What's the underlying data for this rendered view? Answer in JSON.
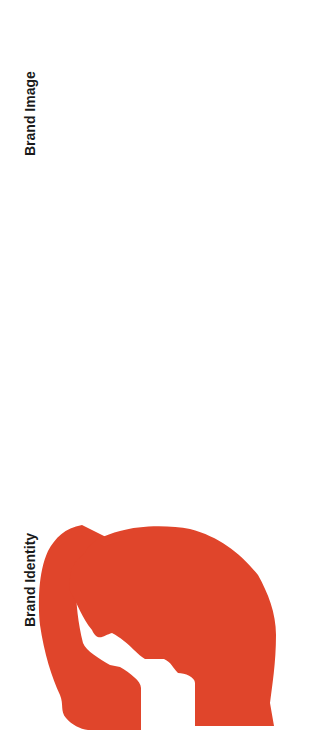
{
  "diagram": {
    "orientation": "rotated-90-ccw",
    "colors": {
      "identity_head": "#e0452b",
      "image_head": "#aaa797",
      "identity_head_text": "#ffffff",
      "image_head_text": "#1a1a1a",
      "box_border": "#3a3a3a",
      "arrow": "#1a1a1a"
    },
    "left_section": {
      "title": "Brand Identity",
      "head_label_line1": "Self-image of",
      "head_label_line2": "internal target groups"
    },
    "right_section": {
      "title": "Brand Image",
      "head_label_line1": "Public-image of",
      "head_label_line2": "external target groups"
    },
    "steps": [
      {
        "label": "Choice of\nsenses",
        "question": "Which senses\nare suited to\nconveying the\nbrand identity?",
        "example": "E.g. sight and\nsmell"
      },
      {
        "label": "Design of the\nstimuli",
        "question": "How should the\nbrand identity be\nconveyed in a\nmulti-sensual\nmanner?",
        "example": "E.g. conveying\nthe brand origin\nby designing the\nbranches\naccordingly"
      },
      {
        "label": "Translation of\nthe multi-\nsensual\ncharacteristics",
        "question": "How do the\nstimuli have to\nbe designed on-\nsite in order to\noptimally convey\nthe brand\nidentity?",
        "example": "E.g. using\ncorresponding\nmaterials (i.e.\nused wood, old\ncoffee sacks)"
      }
    ],
    "flow": [
      "Brand Identity",
      "Choice of senses",
      "Design of the stimuli",
      "Translation of the multi-sensual characteristics",
      "Brand Image"
    ]
  }
}
